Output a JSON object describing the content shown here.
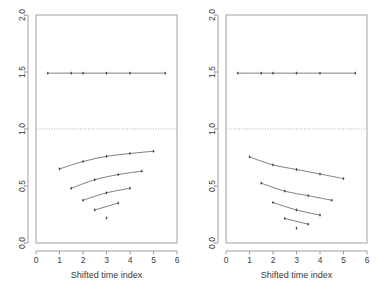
{
  "figure": {
    "title": "",
    "panel_count": 2,
    "background_color": "#ffffff",
    "line_color": "#555555",
    "point_color": "#333333",
    "axis_color": "#8c8c8c",
    "reference_line_color": "#9a9a9a"
  },
  "chart_data": [
    {
      "type": "line",
      "panel": "left",
      "title": "",
      "subtitle": "",
      "xlabel": "Shifted time index",
      "ylabel": "",
      "xlim": [
        0,
        6
      ],
      "ylim": [
        0.0,
        2.0
      ],
      "xticks": [
        0,
        1,
        2,
        3,
        4,
        5,
        6
      ],
      "xtick_labels": [
        "0",
        "1",
        "2",
        "3",
        "4",
        "5",
        "6"
      ],
      "yticks": [
        0.0,
        0.5,
        1.0,
        1.5,
        2.0
      ],
      "ytick_labels": [
        "0.0",
        "0.5",
        "1.0",
        "1.5",
        "2.0"
      ],
      "grid": false,
      "legend": "none",
      "annotations": [
        {
          "type": "hline",
          "y": 1.0,
          "style": "dotted",
          "label": "reference line at 1.0"
        }
      ],
      "series": [
        {
          "name": "flat-upper",
          "marker": "point",
          "x": [
            0.5,
            1.5,
            2.0,
            3.0,
            4.0,
            5.5
          ],
          "y": [
            1.49,
            1.49,
            1.49,
            1.49,
            1.49,
            1.49
          ]
        },
        {
          "name": "curve-1",
          "marker": "point",
          "x": [
            1.0,
            2.0,
            3.0,
            4.0,
            5.0
          ],
          "y": [
            0.65,
            0.715,
            0.76,
            0.785,
            0.805
          ]
        },
        {
          "name": "curve-2",
          "marker": "point",
          "x": [
            1.5,
            2.5,
            3.5,
            4.5
          ],
          "y": [
            0.48,
            0.555,
            0.6,
            0.63
          ]
        },
        {
          "name": "curve-3",
          "marker": "point",
          "x": [
            2.0,
            3.0,
            4.0
          ],
          "y": [
            0.375,
            0.44,
            0.48
          ]
        },
        {
          "name": "curve-4",
          "marker": "point",
          "x": [
            2.5,
            3.5
          ],
          "y": [
            0.29,
            0.35
          ]
        },
        {
          "name": "single-point",
          "marker": "point",
          "x": [
            3.0
          ],
          "y": [
            0.22
          ]
        }
      ]
    },
    {
      "type": "line",
      "panel": "right",
      "title": "",
      "subtitle": "",
      "xlabel": "Shifted time index",
      "ylabel": "",
      "xlim": [
        0,
        6
      ],
      "ylim": [
        0.0,
        2.0
      ],
      "xticks": [
        0,
        1,
        2,
        3,
        4,
        5,
        6
      ],
      "xtick_labels": [
        "0",
        "1",
        "2",
        "3",
        "4",
        "5",
        "6"
      ],
      "yticks": [
        0.0,
        0.5,
        1.0,
        1.5,
        2.0
      ],
      "ytick_labels": [
        "0.0",
        "0.5",
        "1.0",
        "1.5",
        "2.0"
      ],
      "grid": false,
      "legend": "none",
      "annotations": [
        {
          "type": "hline",
          "y": 1.0,
          "style": "dotted",
          "label": "reference line at 1.0"
        }
      ],
      "series": [
        {
          "name": "flat-upper",
          "marker": "point",
          "x": [
            0.5,
            1.5,
            2.0,
            3.0,
            4.0,
            5.5
          ],
          "y": [
            1.49,
            1.49,
            1.49,
            1.49,
            1.49,
            1.49
          ]
        },
        {
          "name": "curve-1",
          "marker": "point",
          "x": [
            1.0,
            2.0,
            3.0,
            4.0,
            5.0
          ],
          "y": [
            0.755,
            0.685,
            0.645,
            0.605,
            0.565
          ]
        },
        {
          "name": "curve-2",
          "marker": "point",
          "x": [
            1.5,
            2.5,
            3.5,
            4.5
          ],
          "y": [
            0.525,
            0.455,
            0.415,
            0.375
          ]
        },
        {
          "name": "curve-3",
          "marker": "point",
          "x": [
            2.0,
            3.0,
            4.0
          ],
          "y": [
            0.355,
            0.29,
            0.245
          ]
        },
        {
          "name": "curve-4",
          "marker": "point",
          "x": [
            2.5,
            3.5
          ],
          "y": [
            0.215,
            0.165
          ]
        },
        {
          "name": "single-point",
          "marker": "point",
          "x": [
            3.0
          ],
          "y": [
            0.13
          ]
        }
      ]
    }
  ],
  "panels": [
    {
      "id": "left",
      "xlabel": "Shifted time index",
      "xtick_labels": [
        "0",
        "1",
        "2",
        "3",
        "4",
        "5",
        "6"
      ],
      "ytick_labels": [
        "0.0",
        "0.5",
        "1.0",
        "1.5",
        "2.0"
      ]
    },
    {
      "id": "right",
      "xlabel": "Shifted time index",
      "xtick_labels": [
        "0",
        "1",
        "2",
        "3",
        "4",
        "5",
        "6"
      ],
      "ytick_labels": [
        "0.0",
        "0.5",
        "1.0",
        "1.5",
        "2.0"
      ]
    }
  ]
}
